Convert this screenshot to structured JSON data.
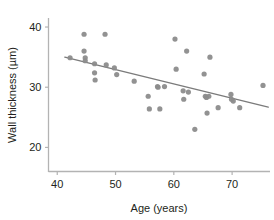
{
  "chart_data": {
    "type": "scatter",
    "title": "",
    "xlabel": "Age (years)",
    "ylabel": "Wall thickness (µm)",
    "xlim": [
      38.5,
      76.5
    ],
    "ylim": [
      16.0,
      41.5
    ],
    "xticks": [
      40,
      50,
      60,
      70
    ],
    "xtick_labels": [
      "40",
      "50",
      "60",
      "70"
    ],
    "yticks": [
      20,
      30,
      40
    ],
    "ytick_labels": [
      "20",
      "30",
      "40"
    ],
    "grid": false,
    "legend": null,
    "marker": {
      "shape": "circle",
      "color": "#8c8c8c",
      "size_px": 5.2,
      "opacity": 0.95
    },
    "series": [
      {
        "name": "Wall thickness vs age",
        "points": [
          [
            42.2,
            34.9
          ],
          [
            44.6,
            38.8
          ],
          [
            44.6,
            36.0
          ],
          [
            44.8,
            34.9
          ],
          [
            44.8,
            34.4
          ],
          [
            46.4,
            33.9
          ],
          [
            46.4,
            32.4
          ],
          [
            46.5,
            31.2
          ],
          [
            48.2,
            38.8
          ],
          [
            48.4,
            33.7
          ],
          [
            49.8,
            33.2
          ],
          [
            50.2,
            32.1
          ],
          [
            53.2,
            31.0
          ],
          [
            55.6,
            28.5
          ],
          [
            55.8,
            26.4
          ],
          [
            57.2,
            30.1
          ],
          [
            57.3,
            30.0
          ],
          [
            57.6,
            26.4
          ],
          [
            58.4,
            30.1
          ],
          [
            60.2,
            38.0
          ],
          [
            60.4,
            33.0
          ],
          [
            61.6,
            29.4
          ],
          [
            61.7,
            28.0
          ],
          [
            62.2,
            36.0
          ],
          [
            62.5,
            29.2
          ],
          [
            63.6,
            23.0
          ],
          [
            65.2,
            32.2
          ],
          [
            65.4,
            28.5
          ],
          [
            65.6,
            28.3
          ],
          [
            65.7,
            25.7
          ],
          [
            66.0,
            28.5
          ],
          [
            66.2,
            35.0
          ],
          [
            67.6,
            26.6
          ],
          [
            69.8,
            28.8
          ],
          [
            69.9,
            28.0
          ],
          [
            70.2,
            27.7
          ],
          [
            71.3,
            26.6
          ],
          [
            75.3,
            30.3
          ]
        ]
      }
    ],
    "trend_line": {
      "name": "least-squares fit",
      "color": "#7b7b7b",
      "width_px": 1.4,
      "x_start": 41.3,
      "y_start": 35.0,
      "x_end": 76.2,
      "y_end": 26.7
    },
    "axes_style": {
      "spine_color": "#b3b3b3",
      "spines": [
        "left",
        "bottom"
      ],
      "tick_color": "#b3b3b3",
      "text_color": "#231f20",
      "background": "#ffffff"
    }
  }
}
